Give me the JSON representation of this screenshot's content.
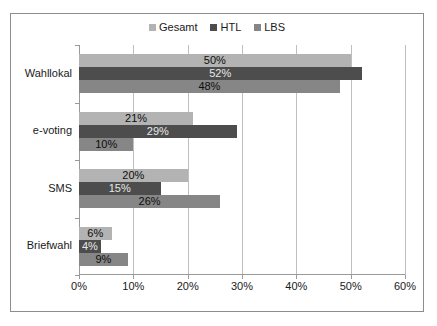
{
  "chart_data": {
    "type": "bar",
    "orientation": "horizontal",
    "title": "",
    "xlabel": "",
    "ylabel": "",
    "xlim": [
      0,
      60
    ],
    "xticks": [
      "0%",
      "10%",
      "20%",
      "30%",
      "40%",
      "50%",
      "60%"
    ],
    "xtick_values": [
      0,
      10,
      20,
      30,
      40,
      50,
      60
    ],
    "grid": true,
    "legend_position": "top-center",
    "categories": [
      "Wahllokal",
      "e-voting",
      "SMS",
      "Briefwahl"
    ],
    "series": [
      {
        "name": "Gesamt",
        "color": "#b3b3b3",
        "values": [
          50,
          21,
          20,
          6
        ],
        "labels": [
          "50%",
          "21%",
          "20%",
          "6%"
        ]
      },
      {
        "name": "HTL",
        "color": "#4d4d4d",
        "values": [
          52,
          29,
          15,
          4
        ],
        "labels": [
          "52%",
          "29%",
          "15%",
          "4%"
        ]
      },
      {
        "name": "LBS",
        "color": "#868686",
        "values": [
          48,
          10,
          26,
          9
        ],
        "labels": [
          "48%",
          "10%",
          "26%",
          "9%"
        ]
      }
    ]
  },
  "legend": {
    "items": [
      {
        "label": "Gesamt",
        "color": "#b3b3b3"
      },
      {
        "label": "HTL",
        "color": "#4d4d4d"
      },
      {
        "label": "LBS",
        "color": "#868686"
      }
    ]
  },
  "colors": {
    "gesamt": "#b3b3b3",
    "htl": "#4d4d4d",
    "lbs": "#868686",
    "gridline": "#bfbfbf",
    "axis": "#9a9a9a",
    "frame": "#8d8d8d",
    "text": "#1a1a1a",
    "background": "#ffffff"
  }
}
